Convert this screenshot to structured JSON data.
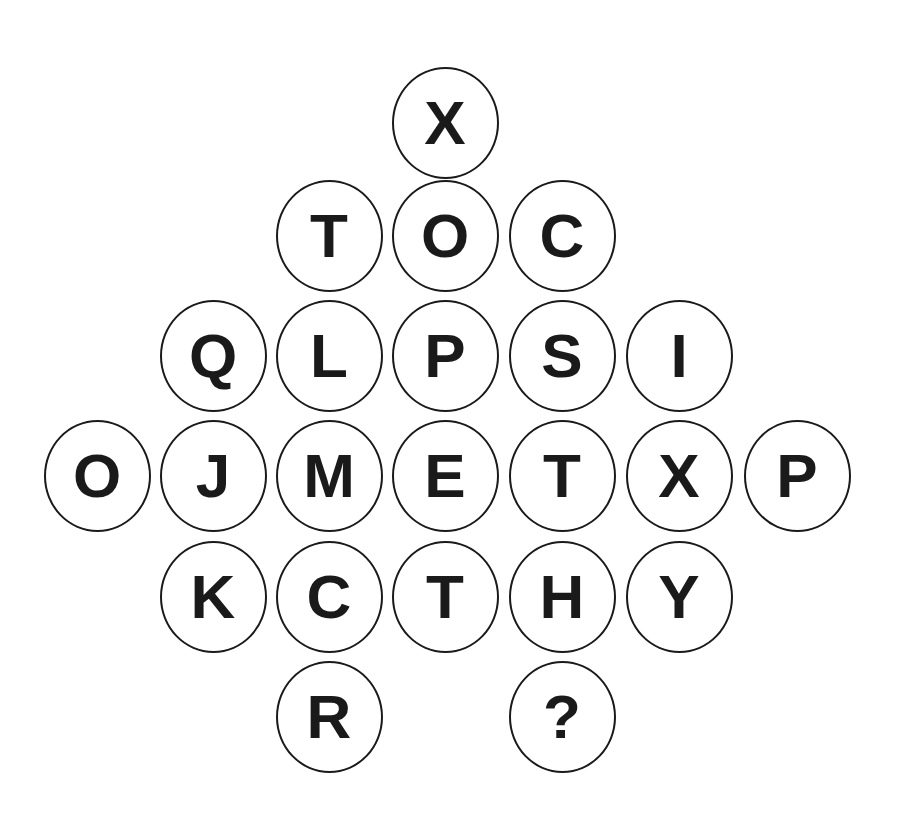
{
  "puzzle": {
    "colors": {
      "stroke": "#1a1a1a",
      "text": "#1a1a1a",
      "background": "#ffffff"
    },
    "cells": [
      {
        "letter": "X",
        "row": 0,
        "col": 3
      },
      {
        "letter": "T",
        "row": 1,
        "col": 2
      },
      {
        "letter": "O",
        "row": 1,
        "col": 3
      },
      {
        "letter": "C",
        "row": 1,
        "col": 4
      },
      {
        "letter": "Q",
        "row": 2,
        "col": 1
      },
      {
        "letter": "L",
        "row": 2,
        "col": 2
      },
      {
        "letter": "P",
        "row": 2,
        "col": 3
      },
      {
        "letter": "S",
        "row": 2,
        "col": 4
      },
      {
        "letter": "I",
        "row": 2,
        "col": 5
      },
      {
        "letter": "O",
        "row": 3,
        "col": 0
      },
      {
        "letter": "J",
        "row": 3,
        "col": 1
      },
      {
        "letter": "M",
        "row": 3,
        "col": 2
      },
      {
        "letter": "E",
        "row": 3,
        "col": 3
      },
      {
        "letter": "T",
        "row": 3,
        "col": 4
      },
      {
        "letter": "X",
        "row": 3,
        "col": 5
      },
      {
        "letter": "P",
        "row": 3,
        "col": 6
      },
      {
        "letter": "K",
        "row": 4,
        "col": 1
      },
      {
        "letter": "C",
        "row": 4,
        "col": 2
      },
      {
        "letter": "T",
        "row": 4,
        "col": 3
      },
      {
        "letter": "H",
        "row": 4,
        "col": 4
      },
      {
        "letter": "Y",
        "row": 4,
        "col": 5
      },
      {
        "letter": "R",
        "row": 5,
        "col": 2
      },
      {
        "letter": "?",
        "row": 5,
        "col": 4
      }
    ]
  }
}
